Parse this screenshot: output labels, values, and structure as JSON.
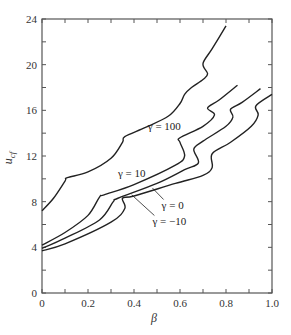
{
  "chart_data": {
    "type": "line",
    "title": "",
    "xlabel": "β",
    "ylabel": "u_cf",
    "xlim": [
      0,
      1.0
    ],
    "ylim": [
      0,
      24
    ],
    "grid": false,
    "legend": "inline curve labels",
    "x_ticks": [
      "0",
      "0.2",
      "0.4",
      "0.6",
      "0.8",
      "1.0"
    ],
    "y_ticks": [
      "0",
      "4",
      "8",
      "12",
      "16",
      "20",
      "24"
    ],
    "series": [
      {
        "name": "γ = 100",
        "label_pos": [
          0.46,
          14.3
        ],
        "points": [
          [
            0,
            7.2
          ],
          [
            0.05,
            8.3
          ],
          [
            0.1,
            9.8
          ],
          [
            0.11,
            10.1
          ],
          [
            0.2,
            10.6
          ],
          [
            0.3,
            11.8
          ],
          [
            0.35,
            13.2
          ],
          [
            0.36,
            13.7
          ],
          [
            0.45,
            14.5
          ],
          [
            0.55,
            15.5
          ],
          [
            0.6,
            16.6
          ],
          [
            0.62,
            17.4
          ],
          [
            0.65,
            18.0
          ],
          [
            0.7,
            18.7
          ],
          [
            0.72,
            19.2
          ],
          [
            0.7,
            20.1
          ],
          [
            0.74,
            21.4
          ],
          [
            0.8,
            23.4
          ]
        ]
      },
      {
        "name": "γ = 10",
        "label_pos": [
          0.33,
          10.2
        ],
        "points": [
          [
            0,
            4.2
          ],
          [
            0.1,
            5.3
          ],
          [
            0.2,
            6.8
          ],
          [
            0.25,
            8.4
          ],
          [
            0.27,
            8.6
          ],
          [
            0.4,
            9.5
          ],
          [
            0.58,
            11.2
          ],
          [
            0.62,
            12.0
          ],
          [
            0.6,
            13.2
          ],
          [
            0.6,
            13.6
          ],
          [
            0.7,
            14.6
          ],
          [
            0.75,
            15.6
          ],
          [
            0.72,
            16.2
          ],
          [
            0.77,
            16.9
          ],
          [
            0.85,
            18.2
          ]
        ]
      },
      {
        "name": "γ = 0",
        "label_pos": [
          0.52,
          7.4
        ],
        "points": [
          [
            0,
            3.9
          ],
          [
            0.1,
            4.8
          ],
          [
            0.25,
            6.4
          ],
          [
            0.31,
            8.0
          ],
          [
            0.33,
            8.3
          ],
          [
            0.5,
            9.6
          ],
          [
            0.62,
            10.8
          ],
          [
            0.68,
            11.4
          ],
          [
            0.66,
            12.6
          ],
          [
            0.7,
            13.3
          ],
          [
            0.8,
            14.6
          ],
          [
            0.83,
            15.4
          ],
          [
            0.82,
            16.1
          ],
          [
            0.87,
            16.7
          ],
          [
            0.95,
            17.9
          ]
        ]
      },
      {
        "name": "γ = −10",
        "label_pos": [
          0.48,
          6.0
        ],
        "points": [
          [
            0,
            3.7
          ],
          [
            0.1,
            4.3
          ],
          [
            0.3,
            6.2
          ],
          [
            0.36,
            7.4
          ],
          [
            0.35,
            8.3
          ],
          [
            0.4,
            8.5
          ],
          [
            0.58,
            9.6
          ],
          [
            0.7,
            10.3
          ],
          [
            0.74,
            11.0
          ],
          [
            0.74,
            12.2
          ],
          [
            0.82,
            13.2
          ],
          [
            0.91,
            14.6
          ],
          [
            0.94,
            15.6
          ],
          [
            0.93,
            16.4
          ],
          [
            1.0,
            17.4
          ]
        ]
      }
    ]
  }
}
